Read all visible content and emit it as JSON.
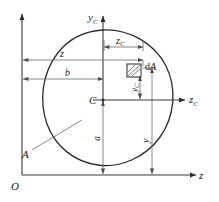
{
  "figure": {
    "background_color": "#ffffff",
    "line_color": "#2b2b2b",
    "dimension_color": "#6a6a6a"
  },
  "axes": {
    "global_origin_label": "O",
    "global_horizontal_label": "z",
    "global_vertical_label": "",
    "centroid_label": "C",
    "centroidal_horizontal_label": "z",
    "centroidal_horizontal_subscript": "C",
    "centroidal_vertical_label": "y",
    "centroidal_vertical_subscript": "C"
  },
  "labels": {
    "area_label": "A",
    "element_label": "d",
    "element_label_italic": "A",
    "dim_z_label": "z",
    "dim_b_label": "b",
    "dim_a_label": "a",
    "dim_y_label": "y",
    "dim_zc_label": "z",
    "dim_zc_subscript": "C",
    "dim_yc_label": "y",
    "dim_yc_subscript": "C"
  },
  "dimensions": {
    "z_description": "horizontal distance from global vertical axis to element dA",
    "b_description": "horizontal distance from global vertical axis to centroid C",
    "zc_description": "horizontal distance from centroid C to element dA",
    "a_description": "vertical distance from global horizontal axis to centroid C",
    "y_description": "vertical distance from global horizontal axis to element dA",
    "yc_description": "vertical distance from centroidal horizontal axis to element dA"
  }
}
